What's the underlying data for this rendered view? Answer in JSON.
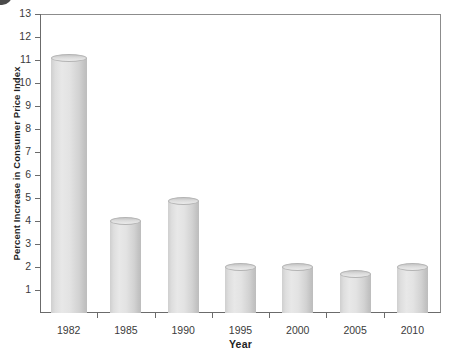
{
  "chart_data": {
    "type": "bar",
    "title": "",
    "xlabel": "Year",
    "ylabel": "Percent Increase in Consumer Price Index",
    "categories": [
      "1982",
      "1985",
      "1990",
      "1995",
      "2000",
      "2005",
      "2010"
    ],
    "values": [
      11.1,
      4.0,
      4.85,
      2.0,
      2.0,
      1.7,
      2.0
    ],
    "ylim": [
      0,
      13
    ],
    "yticks": [
      1,
      2,
      3,
      4,
      5,
      6,
      7,
      8,
      9,
      10,
      11,
      12,
      13
    ],
    "ytick_labels": [
      "1",
      "2",
      "3",
      "4",
      "5",
      "6",
      "7",
      "8",
      "9",
      "10",
      "11",
      "12",
      "13"
    ],
    "grid": false,
    "legend": "none",
    "bar_style": "3d-cylinder",
    "bar_color": "#dcdcdc",
    "axis_color": "#6b6b6b",
    "text_color": "#3b3b3b"
  }
}
